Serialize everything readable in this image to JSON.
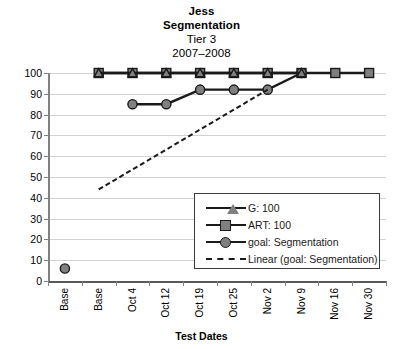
{
  "chart_data": {
    "type": "line",
    "title": "Jess Segmentation Tier 3 2007–2008",
    "title_lines": [
      "Jess",
      "Segmentation",
      "Tier 3",
      "2007–2008"
    ],
    "xlabel": "Test Dates",
    "ylabel": "",
    "categories": [
      "Base",
      "Base",
      "Oct 4",
      "Oct 12",
      "Oct 19",
      "Oct 25",
      "Nov 2",
      "Nov 9",
      "Nov 16",
      "Nov 30"
    ],
    "ylim": [
      0,
      100
    ],
    "ytick_labels": [
      "0",
      "10",
      "20",
      "30",
      "40",
      "50",
      "60",
      "70",
      "80",
      "90",
      "100"
    ],
    "ytick_values": [
      0,
      10,
      20,
      30,
      40,
      50,
      60,
      70,
      80,
      90,
      100
    ],
    "grid": true,
    "legend_position": "inside-lower-right",
    "series": [
      {
        "name": "G: 100",
        "marker": "triangle",
        "values": [
          null,
          100,
          100,
          100,
          100,
          100,
          100,
          100,
          null,
          null
        ]
      },
      {
        "name": "ART: 100",
        "marker": "square",
        "values": [
          null,
          100,
          100,
          100,
          100,
          100,
          100,
          100,
          100,
          100
        ]
      },
      {
        "name": "goal: Segmentation",
        "marker": "circle",
        "values": [
          6,
          null,
          85,
          85,
          92,
          92,
          92,
          100,
          null,
          null
        ]
      },
      {
        "name": "Linear (goal: Segmentation)",
        "marker": "none",
        "style": "dashed",
        "trendline": {
          "x_start": 1,
          "y_start": 44,
          "x_end": 6,
          "y_end": 92
        }
      }
    ],
    "colors": {
      "line": "#1a1a1a",
      "marker_fill": "#808080",
      "marker_edge": "#1a1a1a",
      "gridline": "#d2d2d2",
      "axis": "#808080",
      "background": "#ffffff",
      "legend_border": "#3b3b3b"
    }
  },
  "legend": {
    "items": [
      {
        "label": "G: 100",
        "marker": "triangle-marker-icon"
      },
      {
        "label": "ART: 100",
        "marker": "square-marker-icon"
      },
      {
        "label": "goal: Segmentation",
        "marker": "circle-marker-icon"
      },
      {
        "label": "Linear (goal: Segmentation)",
        "marker": "dashed-line-icon"
      }
    ]
  }
}
